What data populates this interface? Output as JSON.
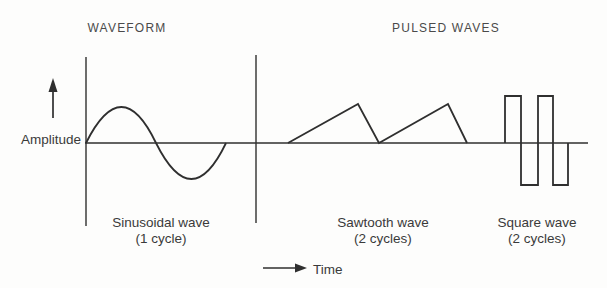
{
  "titles": {
    "waveform": "WAVEFORM",
    "pulsed_waves": "PULSED WAVES"
  },
  "axes": {
    "amplitude": "Amplitude",
    "time": "Time"
  },
  "waves": [
    {
      "name": "Sinusoidal wave",
      "cycles": "(1 cycle)"
    },
    {
      "name": "Sawtooth wave",
      "cycles": "(2 cycles)"
    },
    {
      "name": "Square wave",
      "cycles": "(2 cycles)"
    }
  ],
  "icons": {
    "amplitude_arrow": "up-arrow",
    "time_arrow": "right-arrow"
  },
  "colors": {
    "ink": "#2f2f2f",
    "background": "#fdfdfc"
  }
}
